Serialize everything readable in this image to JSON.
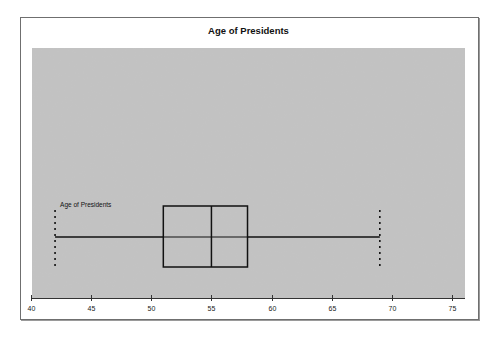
{
  "chart_data": {
    "type": "boxplot",
    "title": "Age of Presidents",
    "xlabel": "",
    "ylabel": "",
    "xlim": [
      40,
      75
    ],
    "xticks": [
      40,
      45,
      50,
      55,
      60,
      65,
      70,
      75
    ],
    "xtick_labels": [
      "40",
      "45",
      "50",
      "55",
      "60",
      "65",
      "70",
      "75"
    ],
    "grid": false,
    "series": [
      {
        "name": "Age of Presidents",
        "min": 42,
        "q1": 51,
        "median": 55,
        "q3": 58,
        "max": 69
      }
    ],
    "colors": {
      "plot_background": "#c3c3c3",
      "box_line": "#111111"
    }
  }
}
